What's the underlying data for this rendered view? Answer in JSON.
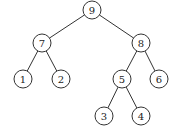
{
  "diagram": {
    "type": "binary-tree",
    "colors": {
      "stroke": "#333333",
      "fill": "#ffffff",
      "text": "#222222"
    },
    "node_radius": 9,
    "nodes": [
      {
        "id": "n9",
        "label": "9",
        "x": 92,
        "y": 10
      },
      {
        "id": "n7",
        "label": "7",
        "x": 42,
        "y": 43
      },
      {
        "id": "n8",
        "label": "8",
        "x": 141,
        "y": 43
      },
      {
        "id": "n1",
        "label": "1",
        "x": 23,
        "y": 79
      },
      {
        "id": "n2",
        "label": "2",
        "x": 61,
        "y": 79
      },
      {
        "id": "n5",
        "label": "5",
        "x": 122,
        "y": 79
      },
      {
        "id": "n6",
        "label": "6",
        "x": 159,
        "y": 79
      },
      {
        "id": "n3",
        "label": "3",
        "x": 104,
        "y": 116
      },
      {
        "id": "n4",
        "label": "4",
        "x": 141,
        "y": 116
      }
    ],
    "edges": [
      {
        "from": "n9",
        "to": "n7"
      },
      {
        "from": "n9",
        "to": "n8"
      },
      {
        "from": "n7",
        "to": "n1"
      },
      {
        "from": "n7",
        "to": "n2"
      },
      {
        "from": "n8",
        "to": "n5"
      },
      {
        "from": "n8",
        "to": "n6"
      },
      {
        "from": "n5",
        "to": "n3"
      },
      {
        "from": "n5",
        "to": "n4"
      }
    ]
  }
}
